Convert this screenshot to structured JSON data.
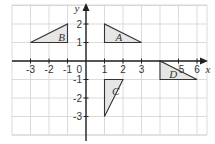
{
  "diagram": {
    "type": "coordinate-grid",
    "x_range": [
      -4,
      6.5
    ],
    "y_range": [
      -4,
      3
    ],
    "x_axis_label": "x",
    "y_axis_label": "y",
    "origin_label": "0",
    "x_ticks": [
      {
        "value": -3,
        "label": "-3"
      },
      {
        "value": -2,
        "label": "-2"
      },
      {
        "value": -1,
        "label": "-1"
      },
      {
        "value": 1,
        "label": "1"
      },
      {
        "value": 2,
        "label": "2"
      },
      {
        "value": 3,
        "label": "3"
      },
      {
        "value": 5,
        "label": "5"
      },
      {
        "value": 6,
        "label": "6"
      }
    ],
    "y_ticks": [
      {
        "value": 2,
        "label": "2"
      },
      {
        "value": 1,
        "label": "1"
      },
      {
        "value": -1,
        "label": "-1"
      },
      {
        "value": -2,
        "label": "-2"
      },
      {
        "value": -3,
        "label": "-3"
      }
    ],
    "shapes": [
      {
        "name": "A",
        "vertices": [
          [
            1,
            2
          ],
          [
            1,
            1
          ],
          [
            3,
            1
          ]
        ],
        "label_at": [
          1.6,
          1.3
        ]
      },
      {
        "name": "B",
        "vertices": [
          [
            -3,
            1
          ],
          [
            -1,
            2
          ],
          [
            -1,
            1
          ]
        ],
        "label_at": [
          -1.5,
          1.3
        ]
      },
      {
        "name": "C",
        "vertices": [
          [
            1,
            -1
          ],
          [
            2,
            -1
          ],
          [
            1,
            -3
          ]
        ],
        "label_at": [
          1.4,
          -1.6
        ]
      },
      {
        "name": "D",
        "vertices": [
          [
            4,
            0
          ],
          [
            4,
            -1
          ],
          [
            6,
            -1
          ]
        ],
        "label_at": [
          4.5,
          -0.7
        ]
      }
    ],
    "colors": {
      "shape_fill": "#e6e6e6",
      "shape_stroke": "#333333",
      "grid": "#d2d2d2",
      "axis": "#222222"
    }
  }
}
